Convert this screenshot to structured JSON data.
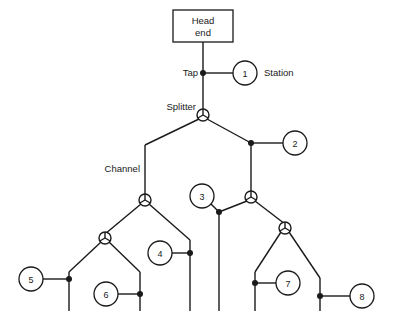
{
  "diagram": {
    "type": "network-topology",
    "canvas": {
      "width": 398,
      "height": 329
    },
    "colors": {
      "background": "#ffffff",
      "line": "#1a1a1a",
      "node_fill": "#ffffff"
    },
    "head_end": {
      "label_line1": "Head",
      "label_line2": "end",
      "x": 173,
      "y": 10,
      "width": 60,
      "height": 32
    },
    "labels": [
      {
        "name": "tap-label",
        "text": "Tap",
        "x": 198,
        "y": 76,
        "anchor": "end"
      },
      {
        "name": "station-label",
        "text": "Station",
        "x": 264,
        "y": 76,
        "anchor": "start"
      },
      {
        "name": "splitter-label",
        "text": "Splitter",
        "x": 196,
        "y": 110,
        "anchor": "end"
      },
      {
        "name": "channel-label",
        "text": "Channel",
        "x": 140,
        "y": 172,
        "anchor": "end"
      }
    ],
    "stations": [
      {
        "id": "1",
        "number": "1",
        "cx": 245,
        "cy": 73,
        "r": 12
      },
      {
        "id": "2",
        "number": "2",
        "cx": 295,
        "cy": 143,
        "r": 12
      },
      {
        "id": "3",
        "number": "3",
        "cx": 202,
        "cy": 196,
        "r": 12
      },
      {
        "id": "4",
        "number": "4",
        "cx": 160,
        "cy": 253,
        "r": 12
      },
      {
        "id": "5",
        "number": "5",
        "cx": 31,
        "cy": 279,
        "r": 12
      },
      {
        "id": "6",
        "number": "6",
        "cx": 106,
        "cy": 294,
        "r": 12
      },
      {
        "id": "7",
        "number": "7",
        "cx": 288,
        "cy": 283,
        "r": 12
      },
      {
        "id": "8",
        "number": "8",
        "cx": 362,
        "cy": 296,
        "r": 12
      }
    ],
    "splitters": [
      {
        "id": "main",
        "cx": 203,
        "cy": 115,
        "r": 6
      },
      {
        "id": "left",
        "cx": 145,
        "cy": 200,
        "r": 6
      },
      {
        "id": "left-lower",
        "cx": 105,
        "cy": 238,
        "r": 6
      },
      {
        "id": "right",
        "cx": 251,
        "cy": 197,
        "r": 6
      },
      {
        "id": "right-lower",
        "cx": 285,
        "cy": 228,
        "r": 6
      }
    ],
    "taps": [
      {
        "id": "tap-station-1",
        "cx": 203,
        "cy": 73,
        "r": 3
      },
      {
        "id": "tap-station-2",
        "cx": 251,
        "cy": 143,
        "r": 3
      },
      {
        "id": "tap-station-3",
        "cx": 219,
        "cy": 212,
        "r": 3
      },
      {
        "id": "tap-station-4",
        "cx": 190,
        "cy": 253,
        "r": 3
      },
      {
        "id": "tap-station-5",
        "cx": 69,
        "cy": 279,
        "r": 3
      },
      {
        "id": "tap-station-6",
        "cx": 140,
        "cy": 294,
        "r": 3
      },
      {
        "id": "tap-station-7",
        "cx": 255,
        "cy": 283,
        "r": 3
      },
      {
        "id": "tap-station-8",
        "cx": 320,
        "cy": 296,
        "r": 3
      }
    ],
    "edges": [
      {
        "id": "headend-to-tap1",
        "d": "M 203 42 L 203 73"
      },
      {
        "id": "tap1-to-splitter",
        "d": "M 203 73 L 203 109"
      },
      {
        "id": "tap1-to-station1",
        "d": "M 203 73 L 233 73"
      },
      {
        "id": "splitter-left-diag",
        "d": "M 199 119 L 145 145"
      },
      {
        "id": "splitter-right-diag",
        "d": "M 207 119 L 251 143"
      },
      {
        "id": "left-trunk-vertical",
        "d": "M 145 145 L 145 194"
      },
      {
        "id": "right-trunk-vertical",
        "d": "M 251 143 L 251 191"
      },
      {
        "id": "tap2-to-station2",
        "d": "M 251 143 L 283 143"
      },
      {
        "id": "left-split-to-lower",
        "d": "M 141 204 L 105 234"
      },
      {
        "id": "left-split-to-tap4",
        "d": "M 149 204 L 190 240"
      },
      {
        "id": "tap4-vertical",
        "d": "M 190 240 L 190 311"
      },
      {
        "id": "tap4-to-station4",
        "d": "M 172 253 L 190 253"
      },
      {
        "id": "leftlower-to-tap5",
        "d": "M 101 242 L 69 272"
      },
      {
        "id": "tap5-vertical",
        "d": "M 69 272 L 69 311"
      },
      {
        "id": "tap5-to-station5",
        "d": "M 43 279 L 69 279"
      },
      {
        "id": "leftlower-to-tap6",
        "d": "M 109 242 L 140 272"
      },
      {
        "id": "tap6-vertical",
        "d": "M 140 272 L 140 311"
      },
      {
        "id": "tap6-to-station6",
        "d": "M 118 294 L 140 294"
      },
      {
        "id": "right-split-to-tap3",
        "d": "M 247 201 L 219 212"
      },
      {
        "id": "tap3-vertical",
        "d": "M 219 212 L 219 311"
      },
      {
        "id": "station3-to-tap3",
        "d": "M 211 204 L 219 212"
      },
      {
        "id": "right-split-to-rightlower",
        "d": "M 255 201 L 285 224"
      },
      {
        "id": "rightlower-to-tap7",
        "d": "M 281 232 L 255 272"
      },
      {
        "id": "tap7-vertical",
        "d": "M 255 272 L 255 311"
      },
      {
        "id": "tap7-to-station7",
        "d": "M 255 283 L 276 283"
      },
      {
        "id": "rightlower-to-tap8",
        "d": "M 289 232 L 320 278"
      },
      {
        "id": "tap8-vertical",
        "d": "M 320 278 L 320 311"
      },
      {
        "id": "tap8-to-station8",
        "d": "M 320 296 L 350 296"
      }
    ]
  }
}
